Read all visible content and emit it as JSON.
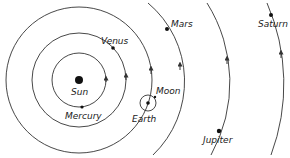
{
  "diagram": {
    "type": "solar-system-orbits",
    "center": "Sun",
    "labels": {
      "sun": "Sun",
      "mercury": "Mercury",
      "venus": "Venus",
      "earth": "Earth",
      "moon": "Moon",
      "mars": "Mars",
      "jupiter": "Jupiter",
      "saturn": "Saturn"
    },
    "bodies": [
      {
        "name": "Sun"
      },
      {
        "name": "Mercury",
        "orbit": "circle"
      },
      {
        "name": "Venus",
        "orbit": "circle"
      },
      {
        "name": "Earth",
        "orbit": "circle",
        "satellite": "Moon"
      },
      {
        "name": "Mars",
        "orbit": "arc"
      },
      {
        "name": "Jupiter",
        "orbit": "arc"
      },
      {
        "name": "Saturn",
        "orbit": "arc"
      }
    ],
    "direction": "counterclockwise (arrows)"
  }
}
